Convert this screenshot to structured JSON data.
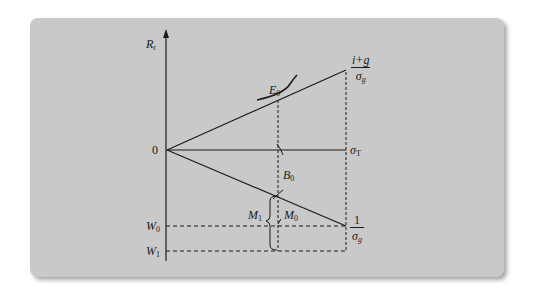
{
  "diagram": {
    "type": "economic-graph",
    "colors": {
      "panel": "#c9c9c9",
      "ink": "#1a1a1a",
      "background": "#ffffff"
    },
    "axis": {
      "y_label": {
        "main": "R",
        "sub": "r"
      },
      "origin_label": "0",
      "w0_label": {
        "main": "W",
        "sub": "0"
      },
      "w1_label": {
        "main": "W",
        "sub": "1"
      }
    },
    "lines": {
      "upper_end_label": {
        "numerator": "i+g",
        "denominator_main": "σ",
        "denominator_sub": "g"
      },
      "horizontal_end_label": {
        "main": "σ",
        "sub": "T"
      },
      "lower_end_label": {
        "numerator": "1",
        "denominator_main": "σ",
        "denominator_sub": "g"
      }
    },
    "points": {
      "e0": {
        "main": "E",
        "sub": "0"
      },
      "b0": {
        "main": "B",
        "sub": "0"
      },
      "m0": {
        "main": "M",
        "sub": "0"
      },
      "m1": {
        "main": "M",
        "sub": "1"
      }
    }
  }
}
